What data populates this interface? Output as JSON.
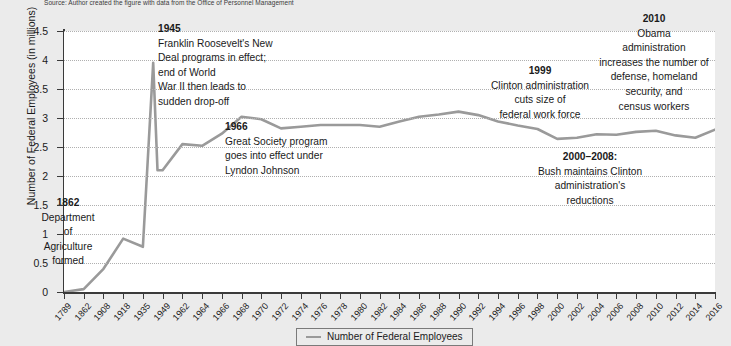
{
  "source_note": "Source: Author created the figure with data from the Office of Personnel Management",
  "legend": {
    "label": "Number of Federal Employees",
    "swatch_name": "line-swatch"
  },
  "colors": {
    "line": "#9a9a9a",
    "axis": "#3a3a3a",
    "gridline": "#b0b0b0",
    "plot_background": "#ffffff",
    "page_background": "#ebebeb"
  },
  "annotations": [
    {
      "id": "ann-1862",
      "year": "1862",
      "lines": [
        "Department",
        "of",
        "Agriculture",
        "formed"
      ],
      "align": "center"
    },
    {
      "id": "ann-1945",
      "year": "1945",
      "lines": [
        "Franklin Roosevelt's New",
        "Deal programs in effect;",
        "end of World",
        "War II then leads to",
        "sudden drop-off"
      ],
      "align": "left"
    },
    {
      "id": "ann-1966",
      "year": "1966",
      "lines": [
        "Great Society program",
        "goes into effect under",
        "Lyndon Johnson"
      ],
      "align": "left"
    },
    {
      "id": "ann-1999",
      "year": "1999",
      "lines": [
        "Clinton administration",
        "cuts size of",
        "federal work force"
      ],
      "align": "center"
    },
    {
      "id": "ann-2000-2008",
      "year": "2000–2008:",
      "lines": [
        "Bush maintains Clinton",
        "administration's",
        "reductions"
      ],
      "align": "center"
    },
    {
      "id": "ann-2010",
      "year": "2010",
      "lines": [
        "Obama",
        "administration",
        "increases the number of",
        "defense, homeland",
        "security, and",
        "census workers"
      ],
      "align": "center"
    }
  ],
  "chart_data": {
    "type": "line",
    "title": "",
    "xlabel": "",
    "ylabel": "Number of Federal Employees (in millions)",
    "ylim": [
      0,
      4.5
    ],
    "yticks": [
      "0",
      "0.5",
      "1",
      "1.5",
      "2",
      "2.5",
      "3",
      "3.5",
      "4",
      "4.5"
    ],
    "ytick_values": [
      0,
      0.5,
      1,
      1.5,
      2,
      2.5,
      3,
      3.5,
      4,
      4.5
    ],
    "grid": true,
    "legend_position": "bottom",
    "categories": [
      "1789",
      "1862",
      "1908",
      "1918",
      "1935",
      "1949",
      "1962",
      "1964",
      "1966",
      "1968",
      "1970",
      "1972",
      "1974",
      "1976",
      "1978",
      "1980",
      "1982",
      "1984",
      "1986",
      "1988",
      "1990",
      "1992",
      "1994",
      "1996",
      "1998",
      "2000",
      "2002",
      "2004",
      "2006",
      "2008",
      "2010",
      "2012",
      "2014",
      "2016"
    ],
    "series": [
      {
        "name": "Number of Federal Employees",
        "values": [
          0.0,
          0.05,
          0.4,
          0.92,
          0.78,
          2.1,
          2.55,
          2.52,
          2.73,
          3.02,
          2.98,
          2.82,
          2.85,
          2.88,
          2.88,
          2.88,
          2.85,
          2.94,
          3.02,
          3.06,
          3.11,
          3.05,
          2.94,
          2.87,
          2.81,
          2.64,
          2.66,
          2.72,
          2.71,
          2.76,
          2.78,
          2.7,
          2.66,
          2.8
        ]
      }
    ],
    "notable_points": [
      {
        "year": "1945",
        "value": 3.95,
        "note": "wartime peak"
      },
      {
        "year": "1947",
        "value": 2.1,
        "note": "post-war drop-off"
      }
    ]
  }
}
